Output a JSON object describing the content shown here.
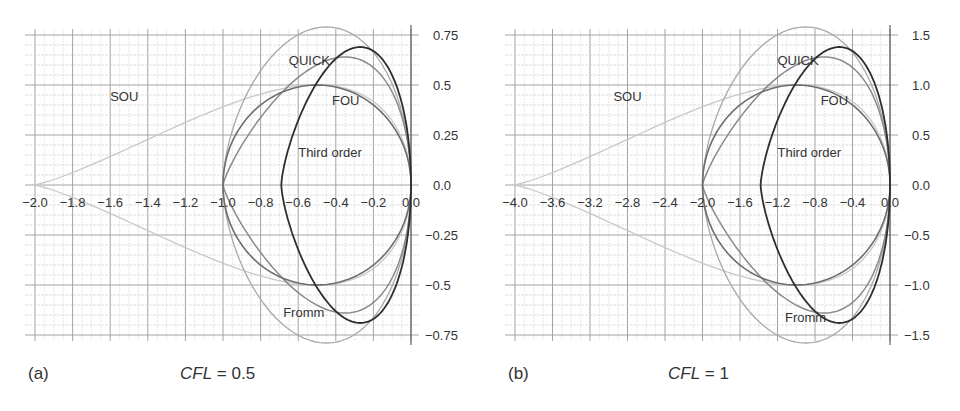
{
  "chart_data": [
    {
      "type": "line",
      "panel_label": "(a)",
      "title": "CFL = 0.5",
      "title_var": "CFL",
      "title_value": "= 0.5",
      "xlabel": "",
      "ylabel": "",
      "xlim": [
        -2.0,
        0.0
      ],
      "ylim": [
        -0.75,
        0.75
      ],
      "grid": true,
      "x_ticks": [
        "-2.0",
        "-1.8",
        "-1.6",
        "-1.4",
        "-1.2",
        "-1.0",
        "-0.8",
        "-0.6",
        "-0.4",
        "-0.2",
        "0.0"
      ],
      "x_tick_values": [
        -2.0,
        -1.8,
        -1.6,
        -1.4,
        -1.2,
        -1.0,
        -0.8,
        -0.6,
        -0.4,
        -0.2,
        0.0
      ],
      "y_ticks": [
        "0.75",
        "0.5",
        "0.25",
        "0.0",
        "-0.25",
        "-0.5",
        "-0.75"
      ],
      "y_tick_values": [
        0.75,
        0.5,
        0.25,
        0.0,
        -0.25,
        -0.5,
        -0.75
      ],
      "series": [
        {
          "name": "SOU",
          "x_min": -2.0,
          "x_max": 0.0,
          "y_max": 0.5,
          "peak_x": -0.5,
          "color": "#c8c8c8",
          "width": 1.3
        },
        {
          "name": "Fromm",
          "x_min": -1.0,
          "x_max": 0.0,
          "y_max": 0.79,
          "peak_x": -0.45,
          "color": "#a8a8a8",
          "width": 1.3
        },
        {
          "name": "QUICK",
          "x_min": -1.0,
          "x_max": 0.0,
          "y_max": 0.64,
          "peak_x": -0.35,
          "color": "#8a8a8a",
          "width": 1.5
        },
        {
          "name": "Third order",
          "x_min": -1.0,
          "x_max": 0.0,
          "y_max": 0.5,
          "peak_x": -0.5,
          "color": "#6e6e6e",
          "width": 1.6
        },
        {
          "name": "FOU",
          "x_min": -0.69,
          "x_max": 0.0,
          "y_max": 0.69,
          "peak_x": -0.27,
          "color": "#2e2e2e",
          "width": 1.8
        }
      ],
      "annotations": [
        {
          "text": "SOU",
          "x": -1.6,
          "y": 0.42
        },
        {
          "text": "QUICK",
          "x": -0.65,
          "y": 0.6
        },
        {
          "text": "FOU",
          "x": -0.42,
          "y": 0.4
        },
        {
          "text": "Third order",
          "x": -0.6,
          "y": 0.14
        },
        {
          "text": "Fromm",
          "x": -0.68,
          "y": -0.66
        }
      ]
    },
    {
      "type": "line",
      "panel_label": "(b)",
      "title": "CFL = 1",
      "title_var": "CFL",
      "title_value": "= 1",
      "xlabel": "",
      "ylabel": "",
      "xlim": [
        -4.0,
        0.0
      ],
      "ylim": [
        -1.5,
        1.5
      ],
      "grid": true,
      "x_ticks": [
        "-4.0",
        "-3.6",
        "-3.2",
        "-2.8",
        "-2.4",
        "-2.0",
        "-1.6",
        "-1.2",
        "-0.8",
        "-0.4",
        "0.0"
      ],
      "x_tick_values": [
        -4.0,
        -3.6,
        -3.2,
        -2.8,
        -2.4,
        -2.0,
        -1.6,
        -1.2,
        -0.8,
        -0.4,
        0.0
      ],
      "y_ticks": [
        "1.5",
        "1.0",
        "0.5",
        "0.0",
        "-0.5",
        "-1.0",
        "-1.5"
      ],
      "y_tick_values": [
        1.5,
        1.0,
        0.5,
        0.0,
        -0.5,
        -1.0,
        -1.5
      ],
      "series": [
        {
          "name": "SOU",
          "x_min": -4.0,
          "x_max": 0.0,
          "y_max": 1.0,
          "peak_x": -1.0,
          "color": "#c8c8c8",
          "width": 1.3
        },
        {
          "name": "Fromm",
          "x_min": -2.0,
          "x_max": 0.0,
          "y_max": 1.58,
          "peak_x": -0.9,
          "color": "#a8a8a8",
          "width": 1.3
        },
        {
          "name": "QUICK",
          "x_min": -2.0,
          "x_max": 0.0,
          "y_max": 1.28,
          "peak_x": -0.7,
          "color": "#8a8a8a",
          "width": 1.5
        },
        {
          "name": "Third order",
          "x_min": -2.0,
          "x_max": 0.0,
          "y_max": 1.0,
          "peak_x": -1.0,
          "color": "#6e6e6e",
          "width": 1.6
        },
        {
          "name": "FOU",
          "x_min": -1.38,
          "x_max": 0.0,
          "y_max": 1.38,
          "peak_x": -0.54,
          "color": "#2e2e2e",
          "width": 1.8
        }
      ],
      "annotations": [
        {
          "text": "SOU",
          "x": -2.95,
          "y": 0.84
        },
        {
          "text": "QUICK",
          "x": -1.2,
          "y": 1.2
        },
        {
          "text": "FOU",
          "x": -0.74,
          "y": 0.8
        },
        {
          "text": "Third order",
          "x": -1.2,
          "y": 0.28
        },
        {
          "text": "Fromm",
          "x": -1.12,
          "y": -1.37
        }
      ]
    }
  ],
  "panels": [
    {
      "label": "(a)",
      "cfl_var": "CFL",
      "cfl_value": "= 0.5"
    },
    {
      "label": "(b)",
      "cfl_var": "CFL",
      "cfl_value": "= 1"
    }
  ]
}
